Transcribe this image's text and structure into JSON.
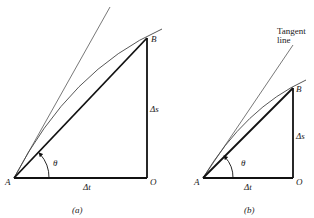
{
  "figures": [
    {
      "id": "a",
      "caption": "(a)",
      "points": {
        "A": "A",
        "B": "B",
        "O": "O"
      },
      "labels": {
        "delta_t": "Δt",
        "delta_s": "Δs",
        "theta": "θ"
      }
    },
    {
      "id": "b",
      "caption": "(b)",
      "points": {
        "A": "A",
        "B": "B",
        "O": "O"
      },
      "labels": {
        "delta_t": "Δt",
        "delta_s": "Δs",
        "theta": "θ"
      },
      "annotation": {
        "line1": "Tangent",
        "line2": "line"
      }
    }
  ]
}
